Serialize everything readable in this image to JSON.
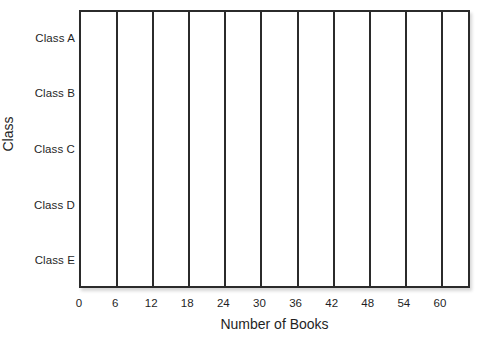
{
  "chart_data": {
    "type": "bar",
    "orientation": "horizontal",
    "title": "",
    "subtitle": "",
    "xlabel": "Number of Books",
    "ylabel": "Class",
    "categories": [
      "Class A",
      "Class B",
      "Class C",
      "Class D",
      "Class E"
    ],
    "values": [
      null,
      null,
      null,
      null,
      null
    ],
    "series": [],
    "xticks": [
      0,
      6,
      12,
      18,
      24,
      30,
      36,
      42,
      48,
      54,
      60
    ],
    "xtick_labels": [
      "0",
      "6",
      "12",
      "18",
      "24",
      "30",
      "36",
      "42",
      "48",
      "54",
      "60"
    ],
    "xlim": [
      0,
      65
    ],
    "grid": "vertical-only",
    "legend": "none",
    "annotations": [],
    "note": "Empty grid template: axes and vertical gridlines drawn, no bars plotted."
  },
  "axes": {
    "y": {
      "title": "Class",
      "tick_labels": [
        "Class A",
        "Class B",
        "Class C",
        "Class D",
        "Class E"
      ]
    },
    "x": {
      "title": "Number of Books",
      "tick_labels": [
        "0",
        "6",
        "12",
        "18",
        "24",
        "30",
        "36",
        "42",
        "48",
        "54",
        "60"
      ]
    }
  },
  "colors": {
    "axis_line": "#2b2b2b",
    "gridline": "#2b2b2b",
    "text": "#1f1f1f",
    "plot_background": "#ffffff",
    "page_background": "#ffffff"
  }
}
